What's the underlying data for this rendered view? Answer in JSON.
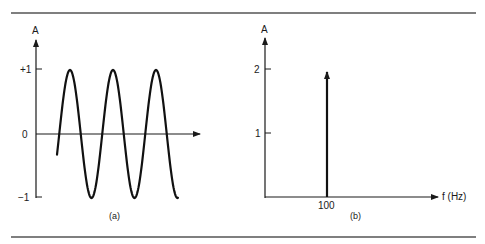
{
  "figure": {
    "panels": [
      {
        "id": "a",
        "caption": "(a)",
        "y_axis_label": "A",
        "y_ticks": [
          "+1",
          "0",
          "−1"
        ],
        "description": "Time-domain sinusoid of amplitude 1 (three cycles shown)"
      },
      {
        "id": "b",
        "caption": "(b)",
        "y_axis_label": "A",
        "y_ticks": [
          "2",
          "1"
        ],
        "x_axis_label": "f (Hz)",
        "x_ticks": [
          "100"
        ],
        "description": "Frequency-domain spectrum: single spectral line at 100 Hz"
      }
    ]
  },
  "chart_data": [
    {
      "type": "line",
      "title": "(a)",
      "xlabel": "",
      "ylabel": "A",
      "ylim": [
        -1,
        1
      ],
      "yticks": [
        1,
        0,
        -1
      ],
      "ytick_labels": [
        "+1",
        "0",
        "−1"
      ],
      "series": [
        {
          "name": "sinusoid",
          "amplitude": 1,
          "cycles_shown": 3,
          "start_value": -0.15,
          "end_value": -1
        }
      ]
    },
    {
      "type": "bar",
      "title": "(b)",
      "xlabel": "f (Hz)",
      "ylabel": "A",
      "ylim": [
        0,
        2.6
      ],
      "yticks": [
        1,
        2
      ],
      "categories": [
        "100"
      ],
      "values": [
        2
      ]
    }
  ]
}
